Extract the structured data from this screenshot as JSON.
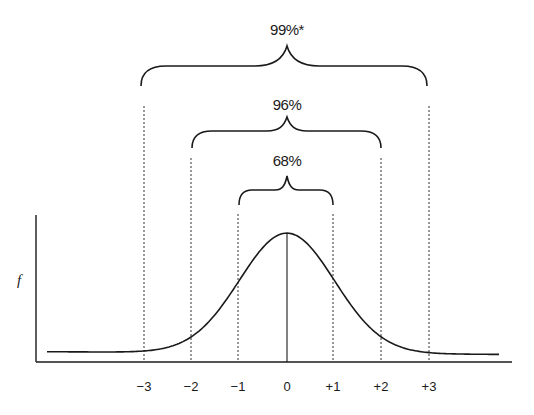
{
  "figure": {
    "ylabel": "f",
    "colors": {
      "line": "#1a1a1a",
      "background": "#ffffff"
    }
  },
  "braces": [
    {
      "label": "68%",
      "from": -1,
      "to": 1
    },
    {
      "label": "96%",
      "from": -2,
      "to": 2
    },
    {
      "label": "99%*",
      "from": -3,
      "to": 3
    }
  ],
  "x_ticks": [
    "−3",
    "−2",
    "−1",
    "0",
    "+1",
    "+2",
    "+3"
  ],
  "chart_data": {
    "type": "line",
    "title": "",
    "xlabel": "",
    "ylabel": "f",
    "curve": "normal density (mean 0, sd 1)",
    "x_ticks": [
      -3,
      -2,
      -1,
      0,
      1,
      2,
      3
    ],
    "tick_labels": [
      "−3",
      "−2",
      "−1",
      "0",
      "+1",
      "+2",
      "+3"
    ],
    "intervals": [
      {
        "range": [
          -1,
          1
        ],
        "label": "68%"
      },
      {
        "range": [
          -2,
          2
        ],
        "label": "96%"
      },
      {
        "range": [
          -3,
          3
        ],
        "label": "99%*"
      }
    ],
    "grid": false,
    "legend": null
  }
}
